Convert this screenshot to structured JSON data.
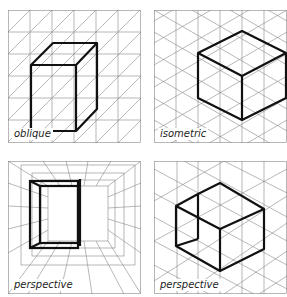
{
  "panels": [
    {
      "id": "oblique",
      "label": "oblique",
      "projection": "oblique"
    },
    {
      "id": "isometric",
      "label": "isometric",
      "projection": "isometric"
    },
    {
      "id": "perspective-1",
      "label": "perspective",
      "projection": "one-point perspective"
    },
    {
      "id": "perspective-2",
      "label": "perspective",
      "projection": "two-point perspective"
    }
  ],
  "colors": {
    "grid": "#888888",
    "shape": "#111111",
    "background": "#ffffff"
  }
}
